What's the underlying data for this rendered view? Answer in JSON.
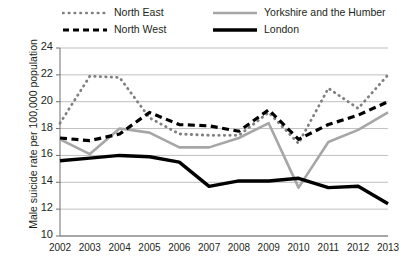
{
  "chart_data": {
    "type": "line",
    "title": "",
    "xlabel": "",
    "ylabel": "Male suicide rate per 100,000 population",
    "categories": [
      "2002",
      "2003",
      "2004",
      "2005",
      "2006",
      "2007",
      "2008",
      "2009",
      "2010",
      "2011",
      "2012",
      "2013"
    ],
    "ylim": [
      10,
      24
    ],
    "yticks": [
      10,
      12,
      14,
      16,
      18,
      20,
      22,
      24
    ],
    "grid": true,
    "legend_position": "top",
    "series": [
      {
        "name": "North East",
        "style": "dotted",
        "color": "#808080",
        "values": [
          18.4,
          21.9,
          21.8,
          18.8,
          17.6,
          17.5,
          17.5,
          19.2,
          16.9,
          21.0,
          19.5,
          22.0
        ]
      },
      {
        "name": "North West",
        "style": "dashed",
        "color": "#000000",
        "values": [
          17.3,
          17.1,
          17.6,
          19.2,
          18.3,
          18.2,
          17.8,
          19.4,
          17.2,
          18.3,
          19.0,
          20.0
        ]
      },
      {
        "name": "Yorkshire and the Humber",
        "style": "solid-gray",
        "color": "#a6a6a6",
        "values": [
          17.2,
          16.1,
          18.0,
          17.7,
          16.6,
          16.6,
          17.3,
          18.4,
          13.6,
          17.0,
          17.9,
          19.2
        ]
      },
      {
        "name": "London",
        "style": "solid-black",
        "color": "#000000",
        "values": [
          15.6,
          15.8,
          16.0,
          15.9,
          15.5,
          13.7,
          14.1,
          14.1,
          14.3,
          13.6,
          13.7,
          12.4
        ]
      }
    ]
  },
  "legend": {
    "north_east": "North East",
    "north_west": "North West",
    "yorkshire": "Yorkshire and the Humber",
    "london": "London"
  },
  "axes": {
    "y_title": "Male suicide rate per 100,000 population"
  },
  "colors": {
    "grid": "#bfbfbf",
    "axis": "#6e6e6e",
    "gray_series": "#a6a6a6",
    "dot_series": "#808080",
    "black_series": "#000000",
    "text": "#231f20"
  }
}
